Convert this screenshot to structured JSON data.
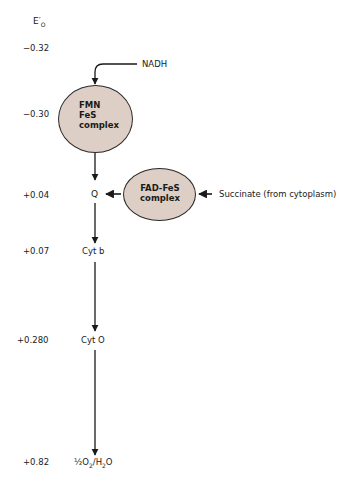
{
  "diagram": {
    "type": "electron-transport-chain",
    "axis_label": "E′o",
    "axis_label_main": "E′",
    "axis_label_sub": "O",
    "potentials": [
      "−0.32",
      "−0.30",
      "+0.04",
      "+0.07",
      "+0.280",
      "+0.82"
    ],
    "inputs": {
      "nadh": "NADH",
      "succinate": "Succinate (from cytoplasm)"
    },
    "complexes": {
      "fmn": [
        "FMN",
        "FeS",
        "complex"
      ],
      "fad": [
        "FAD-FeS",
        "complex"
      ]
    },
    "carriers": {
      "q": "Q",
      "cyt_b": "Cyt b",
      "cyt_o": "Cyt O",
      "terminal_main": "½O",
      "terminal_sub": "2",
      "terminal_sep": "/H",
      "terminal_sub2": "2",
      "terminal_end": "O"
    },
    "flow": [
      "NADH → FMN FeS complex",
      "FMN FeS complex → Q",
      "Succinate → FAD-FeS complex",
      "FAD-FeS complex → Q",
      "Q → Cyt b",
      "Cyt b → Cyt O",
      "Cyt O → ½O2/H2O"
    ],
    "colors": {
      "complex_fill": "#ddcfc5",
      "stroke": "#1a1a1a"
    }
  }
}
